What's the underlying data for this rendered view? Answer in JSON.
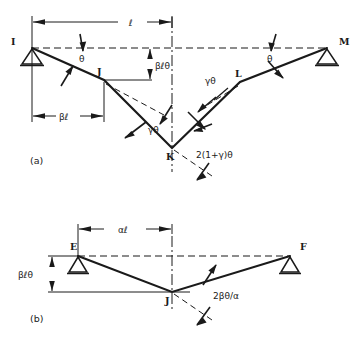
{
  "figure": {
    "background_color": "#ffffff",
    "line_color": "#1a1a1a",
    "panels": [
      {
        "id": "a",
        "label": "(a)",
        "nodes": [
          {
            "name": "I",
            "label": "I",
            "x": 32,
            "y": 48,
            "support": "pinned-triangle"
          },
          {
            "name": "J",
            "label": "J",
            "x": 104,
            "y": 80,
            "support": "none"
          },
          {
            "name": "K",
            "label": "K",
            "x": 172,
            "y": 148,
            "support": "none"
          },
          {
            "name": "L",
            "label": "L",
            "x": 240,
            "y": 82,
            "support": "none"
          },
          {
            "name": "M",
            "label": "M",
            "x": 327,
            "y": 48,
            "support": "pinned-triangle"
          }
        ],
        "dimensions": [
          {
            "label": "ℓ",
            "name": "length-l",
            "from_x": 32,
            "to_x": 172,
            "y": 22
          },
          {
            "label": "βℓ",
            "name": "length-beta-l",
            "from_x": 32,
            "to_x": 104,
            "y": 116
          },
          {
            "label": "βℓθ",
            "name": "deflection-beta-l-theta",
            "from_y": 48,
            "to_y": 80,
            "x": 150
          }
        ],
        "angles": [
          {
            "label": "θ",
            "name": "angle-theta-left",
            "x": 82,
            "y": 63
          },
          {
            "label": "θ",
            "name": "angle-theta-right",
            "x": 272,
            "y": 63
          },
          {
            "label": "γθ",
            "name": "angle-gamma-theta-left",
            "x": 152,
            "y": 124
          },
          {
            "label": "γθ",
            "name": "angle-gamma-theta-right",
            "x": 213,
            "y": 88
          },
          {
            "label": "2(1+γ)θ",
            "name": "angle-two-one-plus-gamma-theta",
            "x": 200,
            "y": 157
          }
        ]
      },
      {
        "id": "b",
        "label": "(b)",
        "nodes": [
          {
            "name": "E",
            "label": "E",
            "x": 78,
            "y": 256,
            "support": "pinned-triangle"
          },
          {
            "name": "J",
            "label": "J",
            "x": 172,
            "y": 292,
            "support": "none"
          },
          {
            "name": "F",
            "label": "F",
            "x": 290,
            "y": 256,
            "support": "pinned-triangle"
          }
        ],
        "dimensions": [
          {
            "label": "αℓ",
            "name": "length-alpha-l",
            "from_x": 78,
            "to_x": 172,
            "y": 229
          },
          {
            "label": "βℓθ",
            "name": "deflection-beta-l-theta",
            "from_y": 256,
            "to_y": 292,
            "x": 52
          }
        ],
        "angles": [
          {
            "label": "2βθ/α",
            "name": "angle-two-beta-theta-over-alpha",
            "x": 213,
            "y": 294
          }
        ]
      }
    ]
  }
}
